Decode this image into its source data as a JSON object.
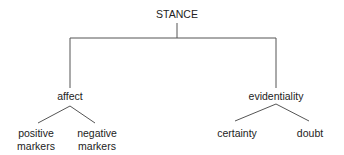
{
  "diagram": {
    "type": "tree",
    "root": {
      "label": "STANCE",
      "children": [
        {
          "label": "affect",
          "children": [
            {
              "label_line1": "positive",
              "label_line2": "markers"
            },
            {
              "label_line1": "negative",
              "label_line2": "markers"
            }
          ]
        },
        {
          "label": "evidentiality",
          "children": [
            {
              "label": "certainty"
            },
            {
              "label": "doubt"
            }
          ]
        }
      ]
    },
    "line_color": "#555555"
  }
}
